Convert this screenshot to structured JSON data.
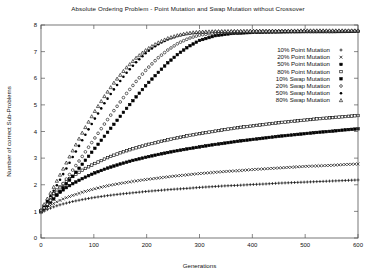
{
  "chart_data": {
    "type": "scatter",
    "title": "Absolute Ordering Problem - Point Mutation and Swap Mutation without Crossover",
    "xlabel": "Generations",
    "ylabel": "Number of correct Sub-Problems",
    "xlim": [
      0,
      600
    ],
    "ylim": [
      0,
      8
    ],
    "xticks": [
      0,
      100,
      200,
      300,
      400,
      500,
      600
    ],
    "yticks": [
      0,
      1,
      2,
      3,
      4,
      5,
      6,
      7,
      8
    ],
    "grid": false,
    "legend_position": "upper-right",
    "series": [
      {
        "name": "10% Point Mutation",
        "marker": "plus",
        "filled": false,
        "x": [
          0,
          10,
          20,
          30,
          40,
          50,
          60,
          80,
          100,
          125,
          150,
          175,
          200,
          225,
          250,
          275,
          300,
          325,
          350,
          375,
          400,
          425,
          450,
          475,
          500,
          525,
          550,
          575,
          600
        ],
        "y": [
          0.95,
          1.05,
          1.14,
          1.21,
          1.27,
          1.32,
          1.37,
          1.45,
          1.52,
          1.59,
          1.65,
          1.7,
          1.75,
          1.79,
          1.83,
          1.86,
          1.9,
          1.93,
          1.96,
          1.98,
          2.01,
          2.03,
          2.06,
          2.08,
          2.1,
          2.12,
          2.14,
          2.16,
          2.18
        ]
      },
      {
        "name": "20% Point Mutation",
        "marker": "cross",
        "filled": false,
        "x": [
          0,
          10,
          20,
          30,
          40,
          50,
          60,
          80,
          100,
          125,
          150,
          175,
          200,
          225,
          250,
          275,
          300,
          325,
          350,
          375,
          400,
          425,
          450,
          475,
          500,
          525,
          550,
          575,
          600
        ],
        "y": [
          0.97,
          1.12,
          1.25,
          1.36,
          1.45,
          1.53,
          1.6,
          1.73,
          1.84,
          1.96,
          2.05,
          2.13,
          2.2,
          2.26,
          2.32,
          2.37,
          2.42,
          2.46,
          2.5,
          2.53,
          2.57,
          2.6,
          2.63,
          2.66,
          2.69,
          2.71,
          2.73,
          2.76,
          2.78
        ]
      },
      {
        "name": "50% Point Mutation",
        "marker": "square",
        "filled": true,
        "x": [
          0,
          10,
          20,
          30,
          40,
          50,
          60,
          80,
          100,
          125,
          150,
          175,
          200,
          225,
          250,
          275,
          300,
          325,
          350,
          375,
          400,
          425,
          450,
          475,
          500,
          525,
          550,
          575,
          600
        ],
        "y": [
          1.0,
          1.25,
          1.45,
          1.63,
          1.78,
          1.92,
          2.04,
          2.25,
          2.43,
          2.62,
          2.78,
          2.92,
          3.04,
          3.15,
          3.25,
          3.34,
          3.42,
          3.5,
          3.57,
          3.64,
          3.7,
          3.76,
          3.82,
          3.87,
          3.92,
          3.97,
          4.01,
          4.06,
          4.1
        ]
      },
      {
        "name": "80% Point Mutation",
        "marker": "square",
        "filled": false,
        "x": [
          0,
          10,
          20,
          30,
          40,
          50,
          60,
          80,
          100,
          125,
          150,
          175,
          200,
          225,
          250,
          275,
          300,
          325,
          350,
          375,
          400,
          425,
          450,
          475,
          500,
          525,
          550,
          575,
          600
        ],
        "y": [
          1.02,
          1.32,
          1.58,
          1.8,
          1.99,
          2.16,
          2.31,
          2.57,
          2.78,
          3.01,
          3.2,
          3.36,
          3.5,
          3.62,
          3.73,
          3.83,
          3.92,
          4.0,
          4.08,
          4.15,
          4.21,
          4.27,
          4.33,
          4.38,
          4.43,
          4.48,
          4.52,
          4.56,
          4.6
        ]
      },
      {
        "name": "10% Swap Mutation",
        "marker": "square",
        "filled": true,
        "x": [
          0,
          10,
          20,
          30,
          40,
          50,
          60,
          80,
          100,
          120,
          140,
          160,
          180,
          200,
          220,
          240,
          260,
          280,
          300,
          330,
          360,
          400,
          450,
          500,
          550,
          600
        ],
        "y": [
          1.0,
          1.18,
          1.38,
          1.6,
          1.84,
          2.08,
          2.32,
          2.82,
          3.32,
          3.82,
          4.32,
          4.82,
          5.3,
          5.76,
          6.18,
          6.58,
          6.92,
          7.2,
          7.42,
          7.6,
          7.68,
          7.72,
          7.74,
          7.75,
          7.75,
          7.76
        ]
      },
      {
        "name": "20% Swap Mutation",
        "marker": "circle",
        "filled": false,
        "x": [
          0,
          10,
          20,
          30,
          40,
          50,
          60,
          80,
          100,
          120,
          140,
          160,
          180,
          200,
          220,
          240,
          260,
          280,
          300,
          330,
          360,
          400,
          450,
          500,
          550,
          600
        ],
        "y": [
          1.0,
          1.22,
          1.46,
          1.72,
          1.99,
          2.27,
          2.55,
          3.12,
          3.7,
          4.28,
          4.84,
          5.38,
          5.88,
          6.34,
          6.74,
          7.06,
          7.32,
          7.5,
          7.62,
          7.7,
          7.73,
          7.75,
          7.76,
          7.76,
          7.76,
          7.77
        ]
      },
      {
        "name": "50% Swap Mutation",
        "marker": "dot",
        "filled": true,
        "x": [
          0,
          10,
          20,
          30,
          40,
          50,
          60,
          80,
          100,
          120,
          140,
          160,
          180,
          200,
          220,
          240,
          260,
          280,
          300,
          330,
          360,
          400,
          450,
          500,
          550,
          600
        ],
        "y": [
          1.02,
          1.32,
          1.64,
          1.98,
          2.33,
          2.68,
          3.04,
          3.74,
          4.42,
          5.06,
          5.64,
          6.16,
          6.6,
          6.98,
          7.26,
          7.46,
          7.6,
          7.68,
          7.72,
          7.75,
          7.76,
          7.77,
          7.77,
          7.78,
          7.78,
          7.78
        ]
      },
      {
        "name": "80% Swap Mutation",
        "marker": "triangle",
        "filled": false,
        "x": [
          0,
          10,
          20,
          30,
          40,
          50,
          60,
          80,
          100,
          120,
          140,
          160,
          180,
          200,
          220,
          240,
          260,
          280,
          300,
          330,
          360,
          400,
          450,
          500,
          550,
          600
        ],
        "y": [
          1.05,
          1.4,
          1.76,
          2.14,
          2.52,
          2.9,
          3.28,
          4.02,
          4.7,
          5.32,
          5.88,
          6.36,
          6.76,
          7.08,
          7.32,
          7.5,
          7.62,
          7.7,
          7.74,
          7.76,
          7.77,
          7.78,
          7.78,
          7.79,
          7.79,
          7.79
        ]
      }
    ]
  }
}
